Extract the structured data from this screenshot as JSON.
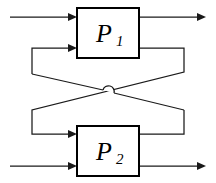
{
  "diagram": {
    "type": "block-diagram",
    "canvas": {
      "width": 216,
      "height": 183,
      "background": "#ffffff"
    },
    "stroke_color": "#1a1a1a",
    "block_border_color": "#000000",
    "blocks": [
      {
        "id": "p1",
        "label_main": "P",
        "label_sub": "1",
        "x": 77,
        "y": 8,
        "width": 62,
        "height": 50
      },
      {
        "id": "p2",
        "label_main": "P",
        "label_sub": "2",
        "x": 77,
        "y": 126,
        "width": 62,
        "height": 50
      }
    ],
    "wires": [
      {
        "id": "input-p1",
        "name": "external-input-p1",
        "points": "10,17 77,17",
        "arrow_at": "end"
      },
      {
        "id": "output-p1",
        "name": "external-output-p1",
        "points": "139,17 205,17",
        "arrow_at": "end"
      },
      {
        "id": "input-p2",
        "name": "external-input-p2",
        "points": "10,166 77,166",
        "arrow_at": "end"
      },
      {
        "id": "output-p2",
        "name": "external-output-p2",
        "points": "139,166 205,166",
        "arrow_at": "end"
      },
      {
        "id": "feedback-p1-to-p2",
        "name": "feedback-path-p1-to-p2",
        "points": "139,48 184,48 184,72 32,110 32,134 77,134",
        "arrow_at": "end"
      },
      {
        "id": "feedback-p2-to-p1",
        "name": "feedback-path-p2-to-p1",
        "points": "139,134 184,134 184,110 32,74 32,48 77,48",
        "arrow_at": "end"
      }
    ],
    "crossover": {
      "name": "wire-hop-crossing",
      "x": 108,
      "y": 91,
      "radius": 5
    }
  }
}
